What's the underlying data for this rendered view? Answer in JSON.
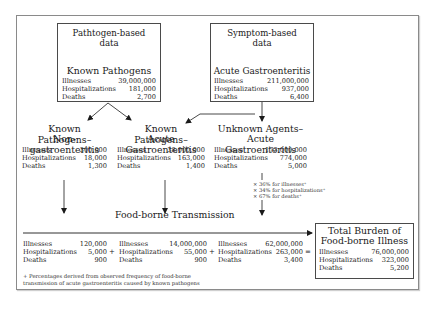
{
  "diagram": {
    "pathogen_box": {
      "source": [
        "Pathtogen-based",
        "data"
      ],
      "title": "Known Pathogens",
      "stats": [
        {
          "label": "Illnesses",
          "value": "39,000,000"
        },
        {
          "label": "Hospitalizations",
          "value": "181,000"
        },
        {
          "label": "Deaths",
          "value": "2,700"
        }
      ]
    },
    "symptom_box": {
      "source": [
        "Symptom-based",
        "data"
      ],
      "title": "Acute Gastroenteritis",
      "stats": [
        {
          "label": "Illnesses",
          "value": "211,000,000"
        },
        {
          "label": "Hospitalizations",
          "value": "937,000"
        },
        {
          "label": "Deaths",
          "value": "6,400"
        }
      ]
    },
    "known_non_gastro": {
      "title": [
        "Known Pathogens–",
        "Non-gastroenteritis"
      ],
      "stats": [
        {
          "label": "Illnesses",
          "value": "300,000"
        },
        {
          "label": "Hospitalizations",
          "value": "18,000"
        },
        {
          "label": "Deaths",
          "value": "1,300"
        }
      ]
    },
    "known_acute_gastro": {
      "title": [
        "Known Pathogens–",
        "Acute Gastroenteritis"
      ],
      "stats": [
        {
          "label": "Illnesses",
          "value": "38,000,000"
        },
        {
          "label": "Hospitalizations",
          "value": "163,000"
        },
        {
          "label": "Deaths",
          "value": "1,400"
        }
      ]
    },
    "unknown_acute_gastro": {
      "title": [
        "Unknown Agents–",
        "Acute Gastroenteritis"
      ],
      "stats": [
        {
          "label": "Illnesses",
          "value": "173,000,000"
        },
        {
          "label": "Hospitalizations",
          "value": "774,000"
        },
        {
          "label": "Deaths",
          "value": "5,000"
        }
      ]
    },
    "multipliers": [
      "× 36% for illnesses⁺",
      "× 34% for hospitalizations⁺",
      "× 67% for deaths⁺"
    ],
    "foodborne_transmission": {
      "title": "Food-borne Transmission",
      "columns": [
        {
          "stats": [
            {
              "label": "Illnesses",
              "value": "120,000"
            },
            {
              "label": "Hospitalizations",
              "value": "5,000"
            },
            {
              "label": "Deaths",
              "value": "900"
            }
          ]
        },
        {
          "stats": [
            {
              "label": "Illnesses",
              "value": "14,000,000"
            },
            {
              "label": "Hospitalizations",
              "value": "55,000"
            },
            {
              "label": "Deaths",
              "value": "900"
            }
          ]
        },
        {
          "stats": [
            {
              "label": "Illnesses",
              "value": "62,000,000"
            },
            {
              "label": "Hospitalizations",
              "value": "263,000"
            },
            {
              "label": "Deaths",
              "value": "3,400"
            }
          ]
        }
      ],
      "operators": [
        "+",
        "+",
        "="
      ]
    },
    "total_burden": {
      "title": [
        "Total Burden of",
        "Food-borne Illness"
      ],
      "stats": [
        {
          "label": "Illnesses",
          "value": "76,000,000"
        },
        {
          "label": "Hospitalizations",
          "value": "323,000"
        },
        {
          "label": "Deaths",
          "value": "5,200"
        }
      ]
    },
    "footnote": [
      "+ Percentages derived from observed frequency of food-borne",
      "transmission of acute gastroenteritis caused by known pathogens"
    ],
    "colors": {
      "line": "#1a1a1a",
      "frame": "#8a8a8a",
      "background": "#ffffff"
    }
  }
}
